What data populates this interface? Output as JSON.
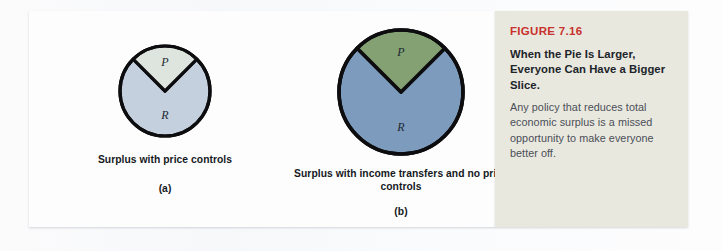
{
  "figure": {
    "number_label": "FIGURE 7.16",
    "title": "When the Pie Is Larger, Everyone Can Have a Bigger Slice.",
    "body": "Any policy that reduces total economic surplus is a missed opportunity to make everyone better off.",
    "accent_color": "#c8322c",
    "caption_panel_color": "#e9e8df"
  },
  "chart_data": [
    {
      "type": "pie",
      "id": "a",
      "panel_letter": "(a)",
      "title": "Surplus with price controls",
      "radius_px": 45,
      "slices": [
        {
          "label": "R",
          "name": "R",
          "value": 75,
          "start_deg": 45,
          "end_deg": 315,
          "color": "#c4d0dd"
        },
        {
          "label": "P",
          "name": "P",
          "value": 25,
          "start_deg": 315,
          "end_deg": 45,
          "color": "#dee5de"
        }
      ]
    },
    {
      "type": "pie",
      "id": "b",
      "panel_letter": "(b)",
      "title": "Surplus with income transfers and no price controls",
      "radius_px": 62,
      "slices": [
        {
          "label": "R",
          "name": "R",
          "value": 75,
          "start_deg": 45,
          "end_deg": 315,
          "color": "#7d9cbd"
        },
        {
          "label": "P",
          "name": "P",
          "value": 25,
          "start_deg": 315,
          "end_deg": 45,
          "color": "#84a174"
        }
      ]
    }
  ]
}
